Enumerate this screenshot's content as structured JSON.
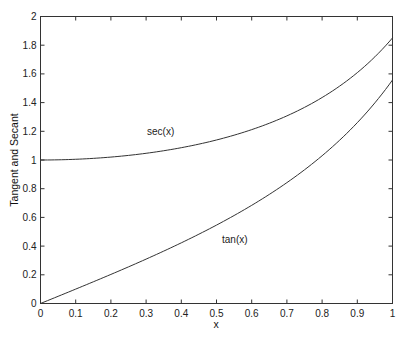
{
  "chart_data": {
    "type": "line",
    "title": "",
    "xlabel": "x",
    "ylabel": "Tangent and Secant",
    "xlim": [
      0,
      1
    ],
    "ylim": [
      0,
      2
    ],
    "grid": false,
    "legend": "none (inline text annotations)",
    "x_ticks": [
      "0",
      "0.1",
      "0.2",
      "0.3",
      "0.4",
      "0.5",
      "0.6",
      "0.7",
      "0.8",
      "0.9",
      "1"
    ],
    "y_ticks": [
      "0",
      "0.2",
      "0.4",
      "0.6",
      "0.8",
      "1",
      "1.2",
      "1.4",
      "1.6",
      "1.8",
      "2"
    ],
    "x": [
      0,
      0.1,
      0.2,
      0.3,
      0.4,
      0.5,
      0.6,
      0.7,
      0.8,
      0.9,
      1.0
    ],
    "series": [
      {
        "name": "sec(x)",
        "values": [
          1.0,
          1.005,
          1.0203,
          1.0468,
          1.0857,
          1.1395,
          1.2116,
          1.3075,
          1.4353,
          1.6087,
          1.8508
        ]
      },
      {
        "name": "tan(x)",
        "values": [
          0.0,
          0.1003,
          0.2027,
          0.3093,
          0.4228,
          0.5463,
          0.6841,
          0.8423,
          1.0296,
          1.2602,
          1.5574
        ]
      }
    ],
    "annotations": [
      {
        "text": "sec(x)",
        "x": 0.31,
        "y": 1.24
      },
      {
        "text": "tan(x)",
        "x": 0.52,
        "y": 0.46
      }
    ]
  },
  "plot": {
    "xlabel": "x",
    "ylabel": "Tangent and Secant",
    "annotation_sec": "sec(x)",
    "annotation_tan": "tan(x)",
    "line_color": "#333333"
  }
}
